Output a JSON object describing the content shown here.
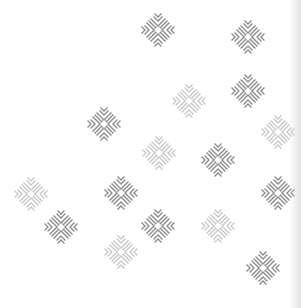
{
  "pattern": {
    "background": "#ffffff",
    "icon": "snowflake-icon",
    "colors": {
      "dark": "#8a8a8a",
      "light": "#c8c8c8"
    },
    "flakes": [
      {
        "x": 158,
        "y": 30,
        "tone": "dark"
      },
      {
        "x": 248,
        "y": 37,
        "tone": "dark"
      },
      {
        "x": 189,
        "y": 101,
        "tone": "light"
      },
      {
        "x": 248,
        "y": 91,
        "tone": "dark"
      },
      {
        "x": 104,
        "y": 124,
        "tone": "dark"
      },
      {
        "x": 278,
        "y": 132,
        "tone": "light"
      },
      {
        "x": 159,
        "y": 153,
        "tone": "light"
      },
      {
        "x": 218,
        "y": 160,
        "tone": "dark"
      },
      {
        "x": 31,
        "y": 194,
        "tone": "light"
      },
      {
        "x": 121,
        "y": 193,
        "tone": "dark"
      },
      {
        "x": 278,
        "y": 193,
        "tone": "dark"
      },
      {
        "x": 61,
        "y": 227,
        "tone": "dark"
      },
      {
        "x": 158,
        "y": 226,
        "tone": "dark"
      },
      {
        "x": 218,
        "y": 226,
        "tone": "light"
      },
      {
        "x": 121,
        "y": 252,
        "tone": "light"
      },
      {
        "x": 263,
        "y": 268,
        "tone": "dark"
      }
    ]
  }
}
